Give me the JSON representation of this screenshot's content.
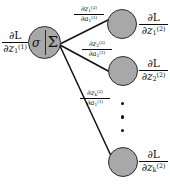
{
  "diagram": {
    "type": "neural-network-backprop",
    "colors": {
      "node_fill": "#a8a8a8",
      "node_stroke": "#2b2b2b",
      "edge": "#111111",
      "text": "#0d0d0d",
      "background": "#ffffff"
    },
    "source_neuron": {
      "activation_symbol": "σ",
      "summation_symbol": "Σ",
      "incoming_gradient_label": {
        "numerator": "∂L",
        "denominator_d": "∂",
        "denominator_var": "z",
        "denominator_sub": "1",
        "denominator_sup": "(1)"
      }
    },
    "edges": [
      {
        "id": "edge-1",
        "label": {
          "num_d": "∂",
          "num_var": "z",
          "num_sub": "1",
          "num_sup": "(2)",
          "den_d": "∂",
          "den_var": "a",
          "den_sub": "1",
          "den_sup": "(1)"
        }
      },
      {
        "id": "edge-2",
        "label": {
          "num_d": "∂",
          "num_var": "z",
          "num_sub": "2",
          "num_sup": "(2)",
          "den_d": "∂",
          "den_var": "a",
          "den_sub": "1",
          "den_sup": "(1)"
        }
      },
      {
        "id": "edge-k",
        "label": {
          "num_d": "∂",
          "num_var": "z",
          "num_sub": "k",
          "num_sup": "(2)",
          "den_d": "∂",
          "den_var": "a",
          "den_sub": "1",
          "den_sup": "(1)"
        }
      }
    ],
    "target_nodes": [
      {
        "id": "node-1",
        "label": {
          "numerator": "∂L",
          "den_d": "∂",
          "den_var": "z",
          "den_sub": "1",
          "den_sup": "(2)"
        }
      },
      {
        "id": "node-2",
        "label": {
          "numerator": "∂L",
          "den_d": "∂",
          "den_var": "z",
          "den_sub": "2",
          "den_sup": "(2)"
        }
      },
      {
        "id": "node-k",
        "label": {
          "numerator": "∂L",
          "den_d": "∂",
          "den_var": "z",
          "den_sub": "k",
          "den_sup": "(2)"
        }
      }
    ],
    "ellipsis": {
      "orientation": "vertical",
      "count": 3
    }
  }
}
